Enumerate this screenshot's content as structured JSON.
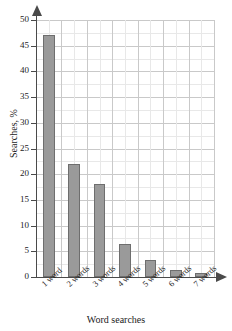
{
  "chart_data": {
    "type": "bar",
    "title": "",
    "xlabel": "Word searches",
    "ylabel": "Searches, %",
    "categories": [
      "1 word",
      "2 words",
      "3 words",
      "4 words",
      "5 words",
      "6 words",
      "7 words"
    ],
    "values": [
      47,
      22,
      18,
      6.5,
      3.4,
      1.4,
      0.8
    ],
    "ylim": [
      0,
      50
    ],
    "ytick_step": 5,
    "yticks": [
      0,
      5,
      10,
      15,
      20,
      25,
      30,
      35,
      40,
      45,
      50
    ],
    "ytick_labels": [
      "0",
      "5",
      "10",
      "15",
      "20",
      "25",
      "30",
      "35",
      "40",
      "45",
      "50"
    ],
    "grid": true,
    "minor_grid": true,
    "legend": "none",
    "bar_color": "#9a9a9a",
    "bar_edge_color": "#6e6e6e",
    "grid_color": "#c9c9c9",
    "minor_grid_color": "#e8e8e8",
    "axis_color": "#4a4a4a",
    "background": "#ffffff",
    "x_axis_arrow": true,
    "y_axis_arrow": true
  }
}
